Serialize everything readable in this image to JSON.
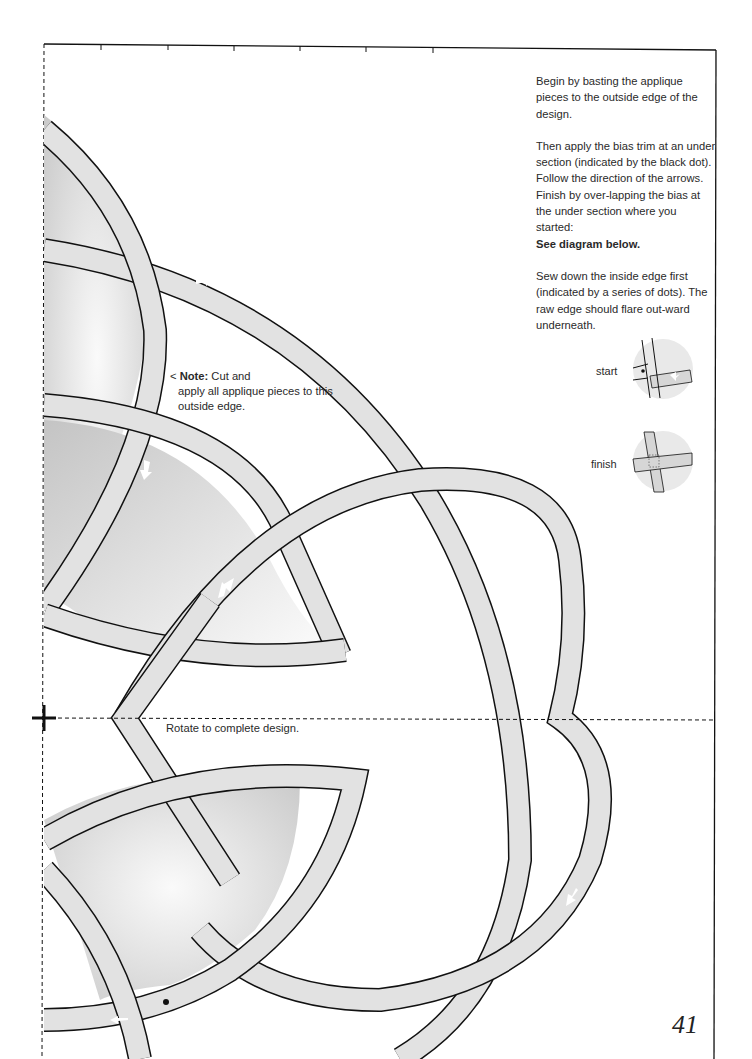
{
  "page": {
    "number": "41",
    "background": "#ffffff",
    "band_fill": "#e2e2e2",
    "outline_color": "#111111"
  },
  "instructions": {
    "paragraph1": "Begin by basting the applique pieces to the outside edge of the design.",
    "paragraph2": "Then apply the bias trim at an under section (indicated by the black dot). Follow the direction of the arrows. Finish by over-lapping the bias at the under section where you started:",
    "paragraph2_bold": "See diagram below.",
    "paragraph3": "Sew down the inside edge first (indicated by a series of dots). The raw edge should flare out-ward underneath."
  },
  "diagrams": {
    "start_label": "start",
    "finish_label": "finish"
  },
  "note": {
    "prefix": "< ",
    "label": "Note:",
    "line1_rest": " Cut and",
    "line2": "apply all applique pieces to this outside edge."
  },
  "rotate_text": "Rotate to complete design.",
  "markers": {
    "center_mark": "plus-registration-mark",
    "start_dot": "black-dot",
    "direction_arrows": 6
  }
}
